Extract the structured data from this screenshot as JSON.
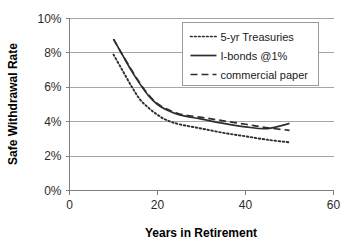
{
  "chart_data": {
    "type": "line",
    "title": "",
    "xlabel": "Years in Retirement",
    "ylabel": "Safe Withdrawal Rate",
    "xlim": [
      0,
      60
    ],
    "ylim": [
      0,
      10
    ],
    "xticks": [
      "0",
      "20",
      "40",
      "60"
    ],
    "xtick_values": [
      0,
      20,
      40,
      60
    ],
    "yticks": [
      "0%",
      "2%",
      "4%",
      "6%",
      "8%",
      "10%"
    ],
    "ytick_values": [
      0,
      2,
      4,
      6,
      8,
      10
    ],
    "grid": "horizontal",
    "legend_position": "top-right",
    "x": [
      10,
      12,
      14,
      16,
      18,
      20,
      22,
      25,
      30,
      35,
      40,
      45,
      50
    ],
    "series": [
      {
        "name": "5-yr Treasuries",
        "style": "dotted",
        "color": "#2e2e2e",
        "values": [
          7.9,
          7.0,
          6.1,
          5.3,
          4.8,
          4.4,
          4.1,
          3.85,
          3.6,
          3.35,
          3.15,
          2.95,
          2.8
        ]
      },
      {
        "name": "I-bonds @1%",
        "style": "solid",
        "color": "#2e2e2e",
        "values": [
          8.8,
          7.9,
          7.0,
          6.2,
          5.5,
          5.0,
          4.7,
          4.4,
          4.15,
          3.9,
          3.7,
          3.6,
          3.9
        ]
      },
      {
        "name": "commercial paper",
        "style": "dashed",
        "color": "#2e2e2e",
        "values": [
          8.8,
          7.9,
          7.05,
          6.25,
          5.55,
          5.05,
          4.75,
          4.45,
          4.25,
          4.05,
          3.85,
          3.65,
          3.5
        ]
      }
    ]
  },
  "legend": {
    "entries": [
      {
        "label": "5-yr Treasuries",
        "style": "dotted"
      },
      {
        "label": "I-bonds @1%",
        "style": "solid"
      },
      {
        "label": "commercial paper",
        "style": "dashed"
      }
    ]
  },
  "colors": {
    "series": "#2e2e2e",
    "grid": "#a6a6a6",
    "axis": "#7f7f7f",
    "text": "#000000",
    "background": "#ffffff"
  }
}
